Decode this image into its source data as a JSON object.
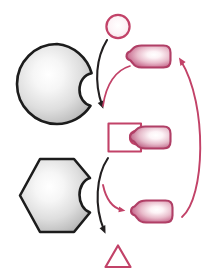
{
  "diagram": {
    "title": "Enzyme-substrate specificity schematic",
    "background_color": "#ffffff",
    "width": 221,
    "height": 278,
    "palette": {
      "pink_stroke": "#c24268",
      "pink_dark": "#a8305a",
      "pink_light": "#e8a6bd",
      "pink_fill_light": "#fdf2f5",
      "gray_outline": "#1c1c1c",
      "gray_light": "#fdfdfd",
      "gray_mid": "#c9c9c9",
      "gray_dark": "#9a9a9a",
      "arrow_black": "#221f20"
    },
    "elements": [
      {
        "id": "substrate-circle",
        "name": "circle-substrate",
        "shape": "circle",
        "label": "",
        "stroke": "#c24268",
        "fill": "#fdf2f5",
        "cx": 118,
        "cy": 26,
        "r": 12
      },
      {
        "id": "enzyme-round",
        "name": "round-enzyme",
        "shape": "circle-with-notch",
        "label": "",
        "stroke": "#1c1c1c",
        "fill": "radial-gradient-gray",
        "cx": 57,
        "cy": 84,
        "r": 40
      },
      {
        "id": "product-flask-top",
        "name": "flask-product-top",
        "shape": "flask",
        "label": "",
        "stroke": "#c24268",
        "fill": "radial-gradient-pink",
        "x": 125,
        "y": 45
      },
      {
        "id": "bracket-complex",
        "name": "bracket-enzyme-complex",
        "shape": "open-rectangle",
        "label": "",
        "stroke": "#c24268",
        "fill": "#ffffff",
        "x": 108,
        "y": 122
      },
      {
        "id": "complex-flask-mid",
        "name": "flask-bound-middle",
        "shape": "flask",
        "label": "",
        "stroke": "#c24268",
        "fill": "radial-gradient-pink",
        "x": 125,
        "y": 122
      },
      {
        "id": "enzyme-hex",
        "name": "hexagon-enzyme",
        "shape": "hexagon-with-notch",
        "label": "",
        "stroke": "#1c1c1c",
        "fill": "radial-gradient-gray",
        "cx": 57,
        "cy": 196
      },
      {
        "id": "product-flask-bottom",
        "name": "flask-product-bottom",
        "shape": "flask",
        "label": "",
        "stroke": "#c24268",
        "fill": "radial-gradient-pink",
        "x": 125,
        "y": 200
      },
      {
        "id": "substrate-triangle",
        "name": "triangle-substrate",
        "shape": "triangle",
        "label": "",
        "stroke": "#c24268",
        "fill": "#ffffff",
        "cx": 118,
        "cy": 258
      }
    ],
    "arrows": [
      {
        "id": "arrow-black-top",
        "name": "arrow-black-upper",
        "color": "#221f20",
        "from": "substrate-circle",
        "to": "bracket-complex",
        "style": "curved",
        "head": "filled-triangle"
      },
      {
        "id": "arrow-pink-top",
        "name": "arrow-pink-upper",
        "color": "#c24268",
        "from": "product-flask-top",
        "to": "enzyme-round-notch",
        "style": "curved",
        "head": "none"
      },
      {
        "id": "arrow-black-bottom",
        "name": "arrow-black-lower",
        "color": "#221f20",
        "from": "enzyme-hex",
        "to": "substrate-triangle",
        "style": "curved",
        "head": "filled-triangle"
      },
      {
        "id": "arrow-pink-bottom",
        "name": "arrow-pink-lower",
        "color": "#c24268",
        "from": "enzyme-hex-notch",
        "to": "product-flask-bottom",
        "style": "curved",
        "head": "filled-triangle"
      },
      {
        "id": "arrow-pink-cycle",
        "name": "arrow-pink-recycle-arc",
        "color": "#c24268",
        "from": "product-flask-bottom",
        "to": "product-flask-top",
        "style": "large-arc",
        "head": "filled-triangle"
      }
    ]
  }
}
